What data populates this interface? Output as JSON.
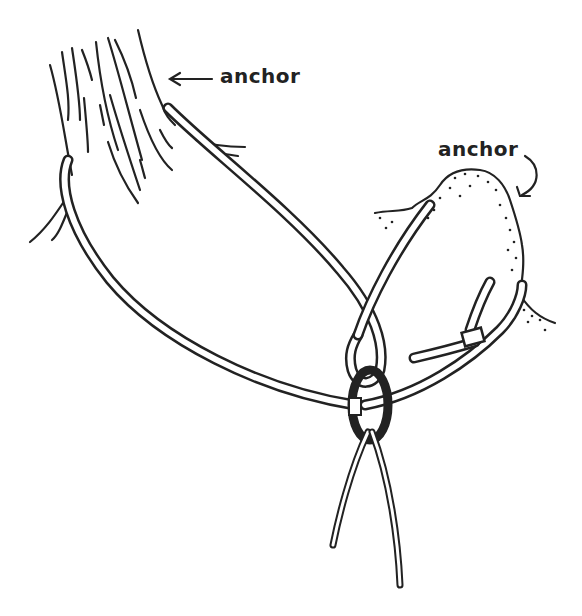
{
  "labels": {
    "tree_anchor": "anchor",
    "rock_anchor": "anchor"
  },
  "figure": {
    "elements": [
      "tree-trunk",
      "rock-horn",
      "sling-around-tree",
      "sling-around-rock",
      "webbing-knot",
      "carabiner",
      "rope-strands"
    ],
    "colors": {
      "ink": "#222222",
      "background": "#ffffff"
    }
  }
}
